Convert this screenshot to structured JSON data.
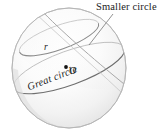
{
  "figure": {
    "type": "geometry-diagram",
    "background_color": "#ffffff",
    "sphere": {
      "name": "sphere",
      "center_x": 69,
      "center_y": 68,
      "radius_x": 57,
      "radius_y": 60,
      "outline_color": "#b9b9b9",
      "fill_light": "#fdfdfd",
      "fill_shadow": "#e2e2e2"
    },
    "curves": [
      {
        "name": "great-circle",
        "stroke": "#7b7b7b"
      },
      {
        "name": "smaller-circle",
        "stroke": "#9a9a9a"
      },
      {
        "name": "meridian-arc",
        "stroke": "#9a9a9a"
      }
    ],
    "center_point": {
      "name": "center-point-O",
      "x": 66,
      "y": 67,
      "color": "#111111",
      "radius": 1.9
    },
    "leader_line": {
      "name": "smaller-circle-leader",
      "from_x": 113,
      "from_y": 14,
      "to_x": 89,
      "to_y": 44,
      "color": "#6e6e6e"
    },
    "labels": {
      "smaller_circle": "Smaller circle",
      "great_circle": "Great circle",
      "radius": "r",
      "center": "O"
    }
  }
}
